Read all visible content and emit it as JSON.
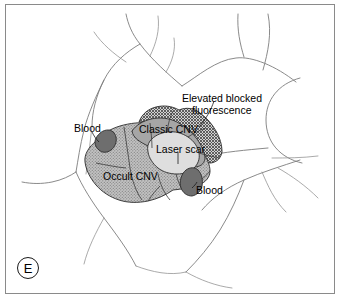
{
  "figure": {
    "panel_letter": "E",
    "type": "fundus-lesion-diagram"
  },
  "labels": {
    "elevated_blocked_fluorescence_line1": "Elevated blocked",
    "elevated_blocked_fluorescence_line2": "fluorescence",
    "classic_cnv": "Classic CNV",
    "occult_cnv": "Occult CNV",
    "laser_scar": "Laser scar",
    "blood_upper_left": "Blood",
    "blood_lower_right": "Blood"
  },
  "regions": [
    {
      "name": "occult-cnv",
      "label": "Occult CNV",
      "texture": "stipple",
      "fill": "#b6b6b6"
    },
    {
      "name": "classic-cnv",
      "label": "Classic CNV",
      "texture": "solid",
      "fill": "#a8a8a8"
    },
    {
      "name": "elevated-blocked-fluorescence",
      "label": "Elevated blocked fluorescence",
      "texture": "crosshatch",
      "fill": "#9c9c9c"
    },
    {
      "name": "laser-scar",
      "label": "Laser scar",
      "texture": "solid",
      "fill": "#dcdcdc"
    },
    {
      "name": "blood-upper-left",
      "label": "Blood",
      "texture": "solid",
      "fill": "#6f6f6f"
    },
    {
      "name": "blood-lower-right",
      "label": "Blood",
      "texture": "solid",
      "fill": "#6f6f6f"
    }
  ],
  "colors": {
    "frame_border": "#8a8a8a",
    "background": "#ffffff",
    "vessel": "#7d7d7d",
    "outline": "#2b2b2b",
    "text": "#000000"
  }
}
